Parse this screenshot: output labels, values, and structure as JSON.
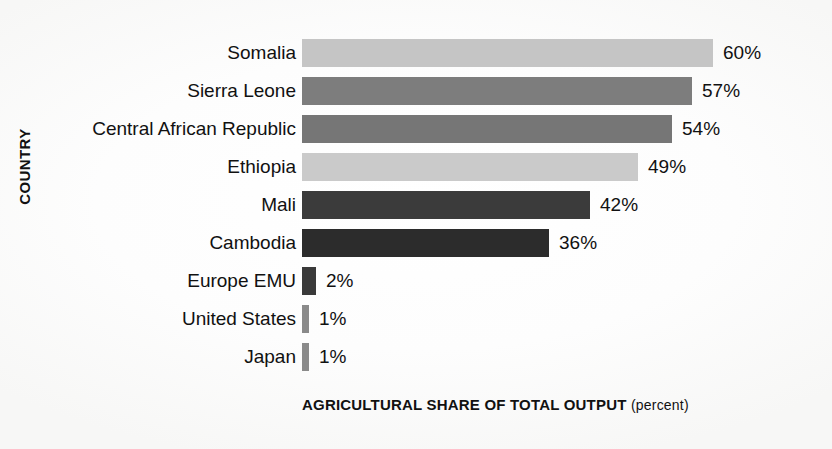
{
  "chart_data": {
    "type": "bar",
    "orientation": "horizontal",
    "title": "",
    "xlabel": "AGRICULTURAL SHARE OF TOTAL OUTPUT",
    "xlabel_unit": "(percent)",
    "ylabel": "COUNTRY",
    "xlim": [
      0,
      60
    ],
    "grid": false,
    "legend": false,
    "categories": [
      "Somalia",
      "Sierra Leone",
      "Central African Republic",
      "Ethiopia",
      "Mali",
      "Cambodia",
      "Europe EMU",
      "United States",
      "Japan"
    ],
    "values": [
      60,
      57,
      54,
      49,
      42,
      36,
      2,
      1,
      1
    ],
    "value_labels": [
      "60%",
      "57%",
      "54%",
      "49%",
      "42%",
      "36%",
      "2%",
      "1%",
      "1%"
    ],
    "bar_colors": [
      "#c5c5c5",
      "#7d7d7d",
      "#767676",
      "#cacaca",
      "#3b3b3b",
      "#2c2c2c",
      "#3a3a3a",
      "#8a8a8a",
      "#8a8a8a"
    ]
  }
}
